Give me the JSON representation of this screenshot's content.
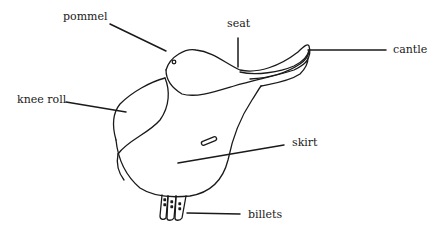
{
  "diagram": {
    "labels": {
      "pommel": "pommel",
      "seat": "seat",
      "cantle": "cantle",
      "knee_roll": "knee roll",
      "skirt": "skirt",
      "billets": "billets"
    },
    "colors": {
      "stroke": "#1a1a1a",
      "background": "#ffffff"
    }
  }
}
